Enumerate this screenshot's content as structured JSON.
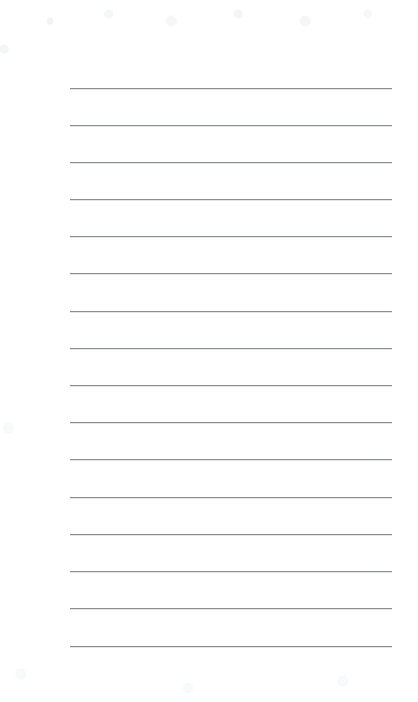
{
  "page": {
    "kind": "lined-paper-sheet",
    "width": 418,
    "height": 702,
    "background_color": "#ffffff",
    "orientation": "portrait",
    "visible_text": ""
  },
  "rules": {
    "label": "horizontal ruled lines",
    "count": 16,
    "color": "#8b8f95",
    "thickness_px": 1,
    "start_x": 70,
    "end_x": 392,
    "length_px": 322,
    "first_y": 88,
    "last_y": 646,
    "spacing_px": 37.2,
    "y_positions": [
      88,
      125,
      162,
      199,
      236,
      273,
      311,
      348,
      385,
      422,
      459,
      497,
      534,
      571,
      608,
      646
    ]
  },
  "margins": {
    "top_px": 88,
    "bottom_px": 56,
    "left_px": 70,
    "right_px": 26,
    "vertical_margin_rule": false
  }
}
